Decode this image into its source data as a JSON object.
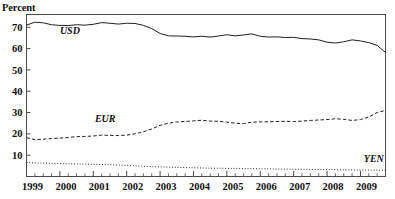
{
  "axis_label": "Percent",
  "chart_data": {
    "type": "line",
    "title": "",
    "xlabel": "",
    "ylabel": "Percent",
    "ylim": [
      0,
      76
    ],
    "yticks": [
      10,
      20,
      30,
      40,
      50,
      60,
      70
    ],
    "xlim": [
      1999.0,
      2009.75
    ],
    "xticks": [
      1999,
      2000,
      2001,
      2002,
      2003,
      2004,
      2005,
      2006,
      2007,
      2008,
      2009
    ],
    "xtick_labels": [
      "1999",
      "2000",
      "2001",
      "2002",
      "2003",
      "2004",
      "2005",
      "2006",
      "2007",
      "2008",
      "2009"
    ],
    "minor_tick_frequency": "quarterly",
    "grid": false,
    "legend": "inline-labels",
    "x": [
      1999.0,
      1999.25,
      1999.5,
      1999.75,
      2000.0,
      2000.25,
      2000.5,
      2000.75,
      2001.0,
      2001.25,
      2001.5,
      2001.75,
      2002.0,
      2002.25,
      2002.5,
      2002.75,
      2003.0,
      2003.25,
      2003.5,
      2003.75,
      2004.0,
      2004.25,
      2004.5,
      2004.75,
      2005.0,
      2005.25,
      2005.5,
      2005.75,
      2006.0,
      2006.25,
      2006.5,
      2006.75,
      2007.0,
      2007.25,
      2007.5,
      2007.75,
      2008.0,
      2008.25,
      2008.5,
      2008.75,
      2009.0,
      2009.25,
      2009.5,
      2009.75
    ],
    "series": [
      {
        "name": "USD",
        "style": "solid",
        "label_x": 2000.0,
        "label_y": 67.0,
        "values": [
          71.0,
          72.4,
          72.1,
          71.2,
          70.9,
          70.8,
          71.2,
          71.0,
          71.4,
          72.2,
          71.9,
          71.5,
          71.9,
          71.8,
          70.9,
          69.4,
          67.1,
          66.0,
          65.9,
          65.8,
          65.5,
          65.8,
          65.4,
          65.9,
          66.5,
          66.0,
          66.4,
          66.9,
          65.8,
          65.4,
          65.5,
          65.2,
          65.3,
          64.7,
          64.5,
          64.1,
          63.0,
          62.6,
          63.2,
          64.1,
          63.6,
          62.8,
          61.5,
          58.2
        ]
      },
      {
        "name": "EUR",
        "style": "dashed",
        "label_x": 2001.05,
        "label_y": 25.5,
        "values": [
          18.2,
          17.3,
          17.5,
          17.8,
          18.0,
          18.3,
          18.7,
          18.8,
          19.0,
          19.4,
          19.3,
          19.2,
          19.4,
          20.0,
          21.0,
          22.3,
          24.0,
          25.0,
          25.6,
          25.8,
          26.1,
          26.4,
          26.0,
          25.9,
          25.5,
          25.0,
          24.8,
          25.5,
          25.6,
          25.7,
          25.8,
          25.9,
          25.8,
          26.0,
          26.3,
          26.5,
          26.7,
          27.1,
          26.8,
          26.3,
          26.7,
          27.9,
          30.0,
          31.0
        ]
      },
      {
        "name": "YEN",
        "style": "dotted",
        "label_x": 2009.1,
        "label_y": 7.0,
        "values": [
          6.6,
          6.4,
          6.3,
          6.2,
          6.1,
          6.0,
          5.9,
          5.8,
          5.7,
          5.6,
          5.5,
          5.4,
          5.2,
          5.0,
          4.8,
          4.6,
          4.5,
          4.4,
          4.3,
          4.2,
          4.1,
          4.0,
          3.9,
          3.9,
          3.8,
          3.8,
          3.7,
          3.7,
          3.6,
          3.6,
          3.5,
          3.5,
          3.4,
          3.4,
          3.3,
          3.3,
          3.2,
          3.2,
          3.1,
          3.1,
          3.0,
          3.0,
          3.0,
          2.9
        ]
      }
    ]
  }
}
